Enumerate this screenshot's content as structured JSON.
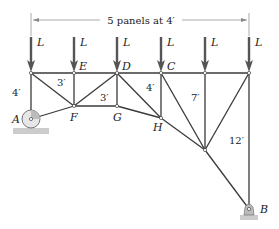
{
  "diagram": {
    "type": "truss",
    "dimension_label": "5 panels at 4′",
    "load_label": "L",
    "loads_count": 6,
    "nodes": {
      "A": {
        "label": "A"
      },
      "B": {
        "label": "B"
      },
      "C": {
        "label": "C"
      },
      "D": {
        "label": "D"
      },
      "E": {
        "label": "E"
      },
      "F": {
        "label": "F"
      },
      "G": {
        "label": "G"
      },
      "H": {
        "label": "H"
      }
    },
    "dimensions": {
      "left_height": "4′",
      "ef_height": "3′",
      "dg_height": "3′",
      "ch_height": "4′",
      "panel4_height": "7′",
      "right_height": "12′"
    },
    "supports": {
      "A": "roller",
      "B": "pin"
    }
  }
}
